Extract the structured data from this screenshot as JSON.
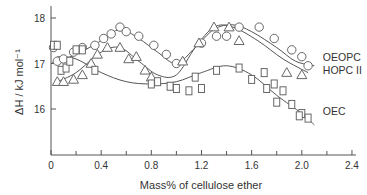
{
  "chart_data": {
    "type": "scatter",
    "title": "",
    "xlabel": "Mass% of cellulose ether",
    "ylabel": "ΔH / kJ mol⁻¹",
    "xlim": [
      0,
      2.4
    ],
    "ylim": [
      15,
      18.2
    ],
    "xticks": [
      0,
      0.4,
      0.8,
      1.2,
      1.6,
      2.0,
      2.4
    ],
    "xtick_labels": [
      "0",
      "0.4",
      "0.8",
      "1.2",
      "1.6",
      "2.0",
      "2.4"
    ],
    "xminor": [
      0.2,
      0.6,
      1.0,
      1.4,
      1.8,
      2.2
    ],
    "yticks": [
      16,
      17,
      18
    ],
    "ytick_labels": [
      "16",
      "17",
      "18"
    ],
    "grid": false,
    "legend_position": "inline-right",
    "series": [
      {
        "name": "OEOPC",
        "marker": "circle",
        "points": [
          [
            0.02,
            17.35
          ],
          [
            0.05,
            17.05
          ],
          [
            0.1,
            17.1
          ],
          [
            0.18,
            17.25
          ],
          [
            0.25,
            17.35
          ],
          [
            0.35,
            17.4
          ],
          [
            0.42,
            17.55
          ],
          [
            0.48,
            17.65
          ],
          [
            0.55,
            17.8
          ],
          [
            0.6,
            17.7
          ],
          [
            0.7,
            17.6
          ],
          [
            0.82,
            17.4
          ],
          [
            0.92,
            17.2
          ],
          [
            1.0,
            17.0
          ],
          [
            1.2,
            17.45
          ],
          [
            1.32,
            17.6
          ],
          [
            1.4,
            17.6
          ],
          [
            1.5,
            17.8
          ],
          [
            1.66,
            17.8
          ],
          [
            1.78,
            17.55
          ],
          [
            1.92,
            17.3
          ],
          [
            2.0,
            17.15
          ],
          [
            2.05,
            16.95
          ]
        ],
        "curve": [
          [
            0.0,
            17.0
          ],
          [
            0.2,
            17.2
          ],
          [
            0.4,
            17.5
          ],
          [
            0.55,
            17.75
          ],
          [
            0.7,
            17.55
          ],
          [
            0.85,
            17.25
          ],
          [
            1.0,
            17.0
          ],
          [
            1.15,
            17.35
          ],
          [
            1.3,
            17.75
          ],
          [
            1.45,
            17.85
          ],
          [
            1.6,
            17.7
          ],
          [
            1.8,
            17.35
          ],
          [
            1.95,
            17.05
          ],
          [
            2.1,
            16.95
          ]
        ]
      },
      {
        "name": "HOPC II",
        "marker": "triangle",
        "points": [
          [
            0.05,
            16.6
          ],
          [
            0.1,
            16.6
          ],
          [
            0.18,
            16.65
          ],
          [
            0.25,
            16.75
          ],
          [
            0.32,
            17.0
          ],
          [
            0.37,
            17.2
          ],
          [
            0.45,
            17.35
          ],
          [
            0.55,
            17.35
          ],
          [
            0.62,
            17.1
          ],
          [
            0.68,
            17.15
          ],
          [
            0.75,
            16.85
          ],
          [
            0.8,
            16.7
          ],
          [
            1.05,
            17.05
          ],
          [
            1.18,
            17.45
          ],
          [
            1.3,
            17.8
          ],
          [
            1.42,
            17.8
          ],
          [
            1.5,
            17.5
          ],
          [
            1.88,
            16.8
          ],
          [
            2.0,
            16.75
          ]
        ],
        "curve": [
          [
            0.05,
            16.6
          ],
          [
            0.2,
            16.8
          ],
          [
            0.4,
            17.25
          ],
          [
            0.55,
            17.35
          ],
          [
            0.7,
            17.05
          ],
          [
            0.85,
            16.75
          ],
          [
            1.0,
            16.75
          ],
          [
            1.15,
            17.35
          ],
          [
            1.3,
            17.8
          ],
          [
            1.45,
            17.8
          ],
          [
            1.65,
            17.5
          ],
          [
            1.85,
            17.1
          ],
          [
            2.05,
            16.8
          ]
        ]
      },
      {
        "name": "OEC",
        "marker": "square",
        "points": [
          [
            0.02,
            17.4
          ],
          [
            0.05,
            17.4
          ],
          [
            0.08,
            16.85
          ],
          [
            0.12,
            16.9
          ],
          [
            0.15,
            17.05
          ],
          [
            0.2,
            17.3
          ],
          [
            0.25,
            17.3
          ],
          [
            0.35,
            16.85
          ],
          [
            0.8,
            16.55
          ],
          [
            0.85,
            16.6
          ],
          [
            0.95,
            16.5
          ],
          [
            1.0,
            16.45
          ],
          [
            1.1,
            16.4
          ],
          [
            1.2,
            16.45
          ],
          [
            1.15,
            16.7
          ],
          [
            1.32,
            16.85
          ],
          [
            1.5,
            16.9
          ],
          [
            1.7,
            16.8
          ],
          [
            1.78,
            16.55
          ],
          [
            1.6,
            16.65
          ],
          [
            1.72,
            16.45
          ],
          [
            1.85,
            16.4
          ],
          [
            1.92,
            16.1
          ],
          [
            2.0,
            15.9
          ],
          [
            1.8,
            16.15
          ],
          [
            1.98,
            15.85
          ],
          [
            2.05,
            15.8
          ]
        ],
        "curve": [
          [
            0.05,
            17.15
          ],
          [
            0.2,
            17.1
          ],
          [
            0.4,
            16.8
          ],
          [
            0.6,
            16.6
          ],
          [
            0.8,
            16.55
          ],
          [
            1.0,
            16.6
          ],
          [
            1.2,
            16.8
          ],
          [
            1.4,
            16.95
          ],
          [
            1.6,
            16.75
          ],
          [
            1.8,
            16.3
          ],
          [
            2.0,
            15.9
          ],
          [
            2.1,
            15.65
          ]
        ]
      }
    ],
    "annotations": [
      {
        "text": "OEOPC",
        "x": 2.12,
        "y": 17.15
      },
      {
        "text": "HOPC  II",
        "x": 2.12,
        "y": 16.85
      },
      {
        "text": "OEC",
        "x": 2.12,
        "y": 15.95
      }
    ]
  }
}
